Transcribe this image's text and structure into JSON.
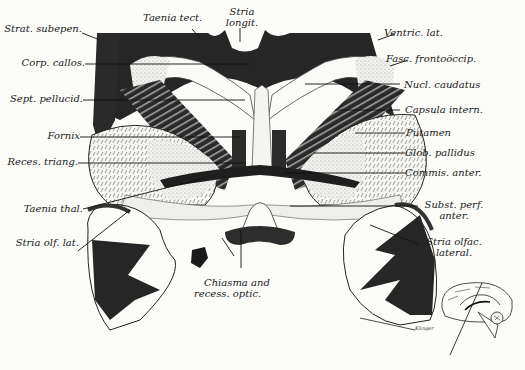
{
  "figure": {
    "artist_signature": "Klingler",
    "inset": "medial view of brain hemisphere with section plane line"
  },
  "labels_left": [
    {
      "id": "strat-subepen",
      "text": "Strat. subepen."
    },
    {
      "id": "corp-callos",
      "text": "Corp. callos."
    },
    {
      "id": "sept-pellucid",
      "text": "Sept. pellucid."
    },
    {
      "id": "fornix",
      "text": "Fornix"
    },
    {
      "id": "reces-triang",
      "text": "Reces. triang."
    },
    {
      "id": "taenia-thal",
      "text": "Taenia thal."
    },
    {
      "id": "stria-olf-lat",
      "text": "Stria olf. lat."
    }
  ],
  "labels_top": [
    {
      "id": "taenia-tect",
      "text": "Taenia tect."
    },
    {
      "id": "stria-longit",
      "lines": [
        "Stria",
        "longit."
      ]
    }
  ],
  "labels_right": [
    {
      "id": "ventric-lat",
      "text": "Ventric. lat."
    },
    {
      "id": "fasc-frontooccip",
      "text": "Fasc. frontoöccip."
    },
    {
      "id": "nucl-caudatus",
      "text": "Nucl. caudatus"
    },
    {
      "id": "capsula-intern",
      "text": "Capsula intern."
    },
    {
      "id": "putamen",
      "text": "Putamen"
    },
    {
      "id": "glob-pallidus",
      "text": "Glob. pallidus"
    },
    {
      "id": "commis-anter",
      "text": "Commis. anter."
    },
    {
      "id": "subst-perf-anter",
      "lines": [
        "Subst. perf.",
        "anter."
      ]
    },
    {
      "id": "stria-olfac-lateral",
      "lines": [
        "Stria olfac.",
        "lateral."
      ]
    }
  ],
  "labels_bottom": [
    {
      "id": "chiasma-recess-optic",
      "lines": [
        "Chiasma and",
        "recess. optic."
      ]
    }
  ]
}
